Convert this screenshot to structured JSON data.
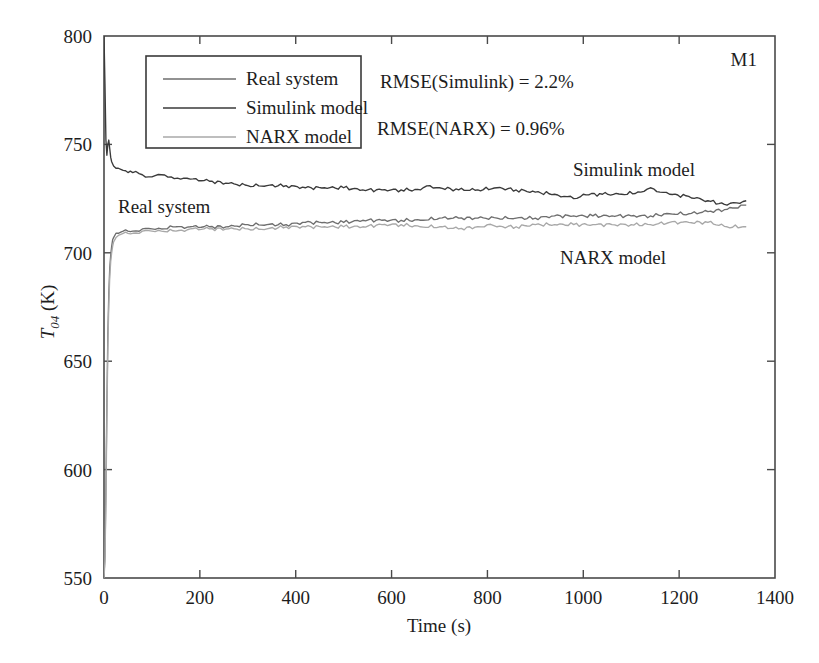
{
  "chart_data": {
    "type": "line",
    "title": "",
    "xlabel": "Time (s)",
    "ylabel": "T04 (K)",
    "ylabel_base": "T",
    "ylabel_sub": "04",
    "ylabel_unit": " (K)",
    "xlim": [
      0,
      1400
    ],
    "ylim": [
      550,
      800
    ],
    "xticks": [
      0,
      200,
      400,
      600,
      800,
      1000,
      1200,
      1400
    ],
    "yticks": [
      550,
      600,
      650,
      700,
      750,
      800
    ],
    "grid": false,
    "legend_position": "upper-left-inside",
    "panel_label": "M1",
    "annotations": [
      {
        "name": "rmse-simulink",
        "text": "RMSE(Simulink) = 2.2%"
      },
      {
        "name": "rmse-narx",
        "text": "RMSE(NARX) = 0.96%"
      },
      {
        "name": "curve-label-real-system",
        "text": "Real system"
      },
      {
        "name": "curve-label-simulink",
        "text": "Simulink model"
      },
      {
        "name": "curve-label-narx",
        "text": "NARX model"
      }
    ],
    "legend": [
      {
        "label": "Real system",
        "color": "#6e6e6e"
      },
      {
        "label": "Simulink model",
        "color": "#3a3a3a"
      },
      {
        "label": "NARX model",
        "color": "#a8a8a8"
      }
    ],
    "series": [
      {
        "name": "Real system",
        "color": "#6e6e6e",
        "x": [
          0,
          2,
          4,
          6,
          8,
          10,
          12,
          14,
          16,
          18,
          20,
          25,
          30,
          40,
          50,
          60,
          80,
          100,
          120,
          150,
          180,
          220,
          260,
          300,
          340,
          380,
          420,
          460,
          500,
          540,
          580,
          620,
          660,
          700,
          740,
          780,
          820,
          860,
          900,
          940,
          980,
          1020,
          1060,
          1100,
          1140,
          1180,
          1220,
          1260,
          1300,
          1340
        ],
        "y": [
          551,
          560,
          592,
          630,
          662,
          681,
          693,
          699,
          703,
          706,
          707,
          709,
          709,
          710,
          710,
          710,
          711,
          711,
          711,
          712,
          712,
          712,
          712,
          713,
          713,
          713,
          714,
          714,
          714,
          715,
          715,
          715,
          715,
          716,
          716,
          716,
          716,
          716,
          716,
          717,
          717,
          717,
          717,
          717,
          717,
          718,
          718,
          719,
          720,
          722
        ]
      },
      {
        "name": "Simulink model",
        "color": "#3a3a3a",
        "x": [
          0,
          2,
          4,
          6,
          8,
          10,
          12,
          14,
          16,
          20,
          25,
          30,
          40,
          50,
          60,
          80,
          100,
          120,
          140,
          160,
          180,
          220,
          260,
          300,
          340,
          380,
          420,
          460,
          500,
          540,
          580,
          620,
          660,
          680,
          700,
          740,
          780,
          820,
          860,
          900,
          940,
          960,
          980,
          1000,
          1040,
          1080,
          1120,
          1140,
          1160,
          1180,
          1220,
          1260,
          1300,
          1320,
          1340
        ],
        "y": [
          800,
          778,
          752,
          745,
          750,
          752,
          748,
          744,
          742,
          740,
          739,
          739,
          738,
          737,
          737,
          736,
          735,
          736,
          735,
          734,
          734,
          733,
          732,
          731,
          731,
          731,
          730,
          730,
          730,
          729,
          729,
          729,
          729,
          731,
          730,
          729,
          729,
          730,
          729,
          728,
          727,
          726,
          725,
          727,
          727,
          727,
          728,
          730,
          728,
          727,
          726,
          724,
          722,
          723,
          724
        ]
      },
      {
        "name": "NARX model",
        "color": "#a8a8a8",
        "x": [
          0,
          2,
          4,
          6,
          8,
          10,
          12,
          14,
          16,
          18,
          20,
          25,
          30,
          40,
          50,
          60,
          80,
          100,
          120,
          150,
          180,
          220,
          260,
          300,
          340,
          380,
          420,
          460,
          500,
          540,
          580,
          620,
          660,
          700,
          740,
          780,
          800,
          820,
          860,
          900,
          940,
          980,
          1020,
          1060,
          1100,
          1140,
          1180,
          1220,
          1260,
          1300,
          1340
        ],
        "y": [
          550,
          558,
          586,
          624,
          656,
          676,
          689,
          696,
          700,
          703,
          705,
          707,
          708,
          709,
          709,
          709,
          710,
          710,
          710,
          710,
          711,
          711,
          711,
          711,
          711,
          712,
          712,
          712,
          712,
          712,
          713,
          713,
          712,
          712,
          711,
          712,
          713,
          712,
          712,
          713,
          713,
          713,
          713,
          713,
          713,
          713,
          714,
          714,
          714,
          712,
          712
        ]
      }
    ]
  },
  "figure": {
    "background": "#ffffff",
    "frame_color": "#4a4a4a"
  }
}
